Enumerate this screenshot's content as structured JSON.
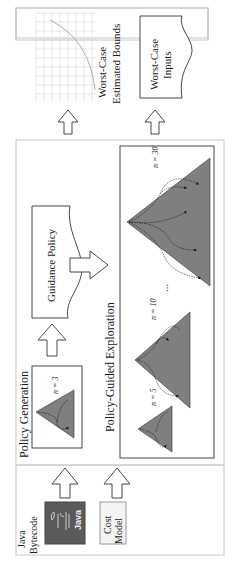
{
  "diagram": {
    "orientation": "rotated-90-ccw",
    "inputs": {
      "java_bytecode_label_line1": "Java",
      "java_bytecode_label_line2": "Bytecode",
      "java_logo_text": "Java",
      "cost_model_line1": "Cost",
      "cost_model_line2": "Model"
    },
    "policy_generation": {
      "title": "Policy Generation",
      "tree_label": "n = 3"
    },
    "guidance_policy": {
      "label": "Guidance Policy"
    },
    "policy_guided_exploration": {
      "title": "Policy-Guided Exploration",
      "trees": [
        {
          "label": "n = 5"
        },
        {
          "label": "n = 10"
        },
        {
          "label": "n = 30"
        }
      ],
      "ellipsis": "..."
    },
    "outputs": {
      "bounds_line1": "Worst-Case",
      "bounds_line2": "Estimated Bounds",
      "inputs_line1": "Worst-Case",
      "inputs_line2": "Inputs"
    },
    "colors": {
      "tree_fill": "#7f7f7f",
      "java_box": "#5a5a5a",
      "panel_border": "#c8c8c8",
      "grid": "#d8d8d8"
    }
  }
}
